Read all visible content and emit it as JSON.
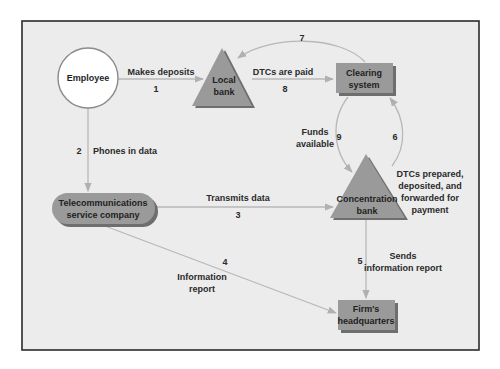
{
  "colors": {
    "frame_bg": "#ececec",
    "frame_border": "#2b2b2b",
    "node_fill": "#9a9a9a",
    "node_shadow": "#6e6e6e",
    "flow_line": "#b8b8b8",
    "employee_fill": "#ffffff"
  },
  "nodes": {
    "employee": {
      "label": "Employee"
    },
    "local_bank": {
      "line1": "Local",
      "line2": "bank"
    },
    "clearing_system": {
      "line1": "Clearing",
      "line2": "system"
    },
    "telecom": {
      "line1": "Telecommunications",
      "line2": "service company"
    },
    "concentration_bank": {
      "line1": "Concentration",
      "line2": "bank"
    },
    "firm_hq": {
      "line1": "Firm's",
      "line2": "headquarters"
    }
  },
  "flows": [
    {
      "step": "1",
      "label_lines": [
        "Makes deposits"
      ]
    },
    {
      "step": "2",
      "label_lines": [
        "Phones in data"
      ]
    },
    {
      "step": "3",
      "label_lines": [
        "Transmits data"
      ]
    },
    {
      "step": "4",
      "label_lines": [
        "Information",
        "report"
      ]
    },
    {
      "step": "5",
      "label_lines": [
        "Sends",
        "information report"
      ]
    },
    {
      "step": "6",
      "label_lines": [
        "DTCs prepared,",
        "deposited, and",
        "forwarded for",
        "payment"
      ]
    },
    {
      "step": "7",
      "label_lines": []
    },
    {
      "step": "8",
      "label_lines": [
        "DTCs are paid"
      ]
    },
    {
      "step": "9",
      "label_lines": [
        "Funds",
        "available"
      ]
    }
  ]
}
